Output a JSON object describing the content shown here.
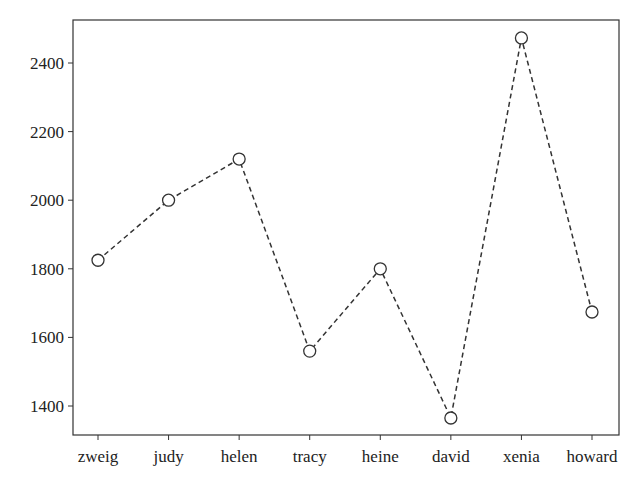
{
  "chart_data": {
    "type": "line",
    "title": "",
    "xlabel": "",
    "ylabel": "",
    "categories": [
      "zweig",
      "judy",
      "helen",
      "tracy",
      "heine",
      "david",
      "xenia",
      "howard"
    ],
    "series": [
      {
        "name": "values",
        "values": [
          1825,
          2000,
          2120,
          1560,
          1800,
          1365,
          2473,
          1674
        ],
        "line_style": "dashed",
        "marker": "open-circle",
        "color": "#333333"
      }
    ],
    "yticks": [
      1400,
      1600,
      1800,
      2000,
      2200,
      2400
    ],
    "ylim": [
      1315,
      2528
    ],
    "grid": false,
    "legend": null
  }
}
